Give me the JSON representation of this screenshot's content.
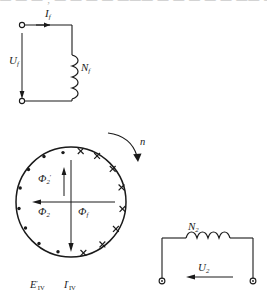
{
  "figure": {
    "top_cut_text": "— — — , — — — — ——— — — — — — —— — — , — — — — — — — — — —"
  },
  "field_circuit": {
    "name": "field-winding-circuit",
    "current_label": "I",
    "current_sub": "f",
    "voltage_label": "U",
    "voltage_sub": "f",
    "coil_label": "N",
    "coil_sub": "f",
    "terminal_count": 2
  },
  "rotor": {
    "name": "rotor-cross-section",
    "rotation_label": "n",
    "flux_primary": {
      "symbol": "Φ",
      "sub": "f",
      "direction": "down"
    },
    "flux_secondary": {
      "symbol": "Φ",
      "sub": "2",
      "direction": "left"
    },
    "flux_secondary_prime": {
      "symbol": "Φ",
      "sub": "2",
      "sup": "′",
      "direction": "up"
    },
    "emf_label": {
      "symbol": "E",
      "sup": "′",
      "sub": "IV"
    },
    "current_label": {
      "symbol": "I",
      "sup": "′",
      "sub": "IV"
    },
    "dot_count": 8,
    "cross_count": 8,
    "dot_meaning": "current-out-of-page",
    "cross_meaning": "current-into-page"
  },
  "secondary_circuit": {
    "name": "secondary-winding-circuit",
    "coil_label": "N",
    "coil_sub": "2",
    "voltage_label": "U",
    "voltage_sub": "2",
    "terminal_count": 2
  },
  "colors": {
    "line": "#1a1a1a",
    "text": "#1a1a1a",
    "background": "#ffffff"
  }
}
